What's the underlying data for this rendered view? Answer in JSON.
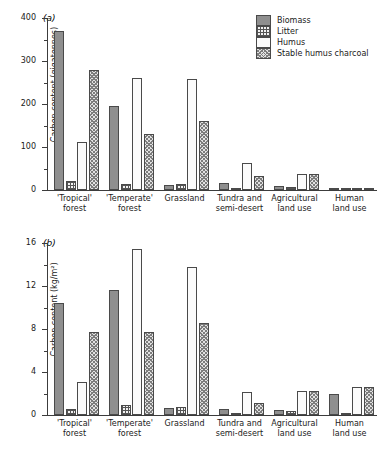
{
  "figure": {
    "background": "#ffffff",
    "series_colors": {
      "biomass": "#8f8f8f",
      "litter": "#f2f2f2",
      "humus": "#fbfbfb",
      "stable_humus_charcoal": "#e2e2e2",
      "outline": "#4a4a4a",
      "axis": "#3c3c3c"
    }
  },
  "panel_a": {
    "label": "(a)"
  },
  "panel_b": {
    "label": "(b)"
  },
  "legend": {
    "items": [
      {
        "label": "Biomass",
        "swatch": "solid-grey-swatch"
      },
      {
        "label": "Litter",
        "swatch": "cross-hatch-swatch"
      },
      {
        "label": "Humus",
        "swatch": "dotted-swatch"
      },
      {
        "label": "Stable humus charcoal",
        "swatch": "diagonal-cross-swatch"
      }
    ]
  },
  "chart_data": [
    {
      "type": "bar",
      "panel": "(a)",
      "title": "",
      "xlabel": "",
      "ylabel": "Carbon content (gigatonnes)",
      "ylim": [
        0,
        400
      ],
      "yticks": [
        0,
        100,
        200,
        300,
        400
      ],
      "yticks_minor": [
        50,
        150,
        250,
        350
      ],
      "grid": false,
      "legend_position": "top-right",
      "categories": [
        "'Tropical' forest",
        "'Temperate' forest",
        "Grassland",
        "Tundra and semi-desert",
        "Agricultural land use",
        "Human land use"
      ],
      "category_lines": [
        [
          "'Tropical'",
          "forest"
        ],
        [
          "'Temperate'",
          "forest"
        ],
        [
          "Grassland"
        ],
        [
          "Tundra and",
          "semi-desert"
        ],
        [
          "Agricultural",
          "land use"
        ],
        [
          "Human",
          "land use"
        ]
      ],
      "series": [
        {
          "name": "Biomass",
          "values": [
            370,
            196,
            11,
            16,
            9,
            3
          ]
        },
        {
          "name": "Litter",
          "values": [
            22,
            14,
            14,
            3,
            7,
            4
          ]
        },
        {
          "name": "Humus",
          "values": [
            111,
            260,
            258,
            62,
            38,
            5
          ]
        },
        {
          "name": "Stable humus charcoal",
          "values": [
            278,
            130,
            161,
            32,
            38,
            5
          ]
        }
      ]
    },
    {
      "type": "bar",
      "panel": "(b)",
      "title": "",
      "xlabel": "",
      "ylabel": "Carbon content (kg/m²)",
      "ylim": [
        0,
        16
      ],
      "yticks": [
        0,
        4,
        8,
        12,
        16
      ],
      "yticks_minor": [
        2,
        6,
        10,
        14
      ],
      "grid": false,
      "legend_position": "top-right",
      "categories": [
        "'Tropical' forest",
        "'Temperate' forest",
        "Grassland",
        "Tundra and semi-desert",
        "Agricultural land use",
        "Human land use"
      ],
      "category_lines": [
        [
          "'Tropical'",
          "forest"
        ],
        [
          "'Temperate'",
          "forest"
        ],
        [
          "Grassland"
        ],
        [
          "Tundra and",
          "semi-desert"
        ],
        [
          "Agricultural",
          "land use"
        ],
        [
          "Human",
          "land use"
        ]
      ],
      "series": [
        {
          "name": "Biomass",
          "values": [
            10.4,
            11.6,
            0.65,
            0.6,
            0.5,
            2.0
          ]
        },
        {
          "name": "Litter",
          "values": [
            0.6,
            0.9,
            0.75,
            0.15,
            0.4,
            0.2
          ]
        },
        {
          "name": "Humus",
          "values": [
            3.05,
            15.4,
            13.8,
            2.15,
            2.2,
            2.6
          ]
        },
        {
          "name": "Stable humus charcoal",
          "values": [
            7.7,
            7.7,
            8.6,
            1.1,
            2.2,
            2.6
          ]
        }
      ]
    }
  ]
}
